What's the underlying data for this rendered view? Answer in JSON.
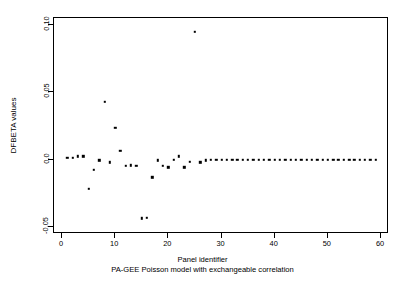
{
  "chart_data": {
    "type": "scatter",
    "title": "",
    "xlabel": "Panel identifier",
    "sublabel": "PA-GEE Poisson model with exchangeable correlation",
    "ylabel": "DFBETA values",
    "xlim": [
      -1.5,
      61.5
    ],
    "ylim": [
      -0.055,
      0.105
    ],
    "xticks": [
      0,
      10,
      20,
      30,
      40,
      50,
      60
    ],
    "xtick_labels": [
      "0",
      "10",
      "20",
      "30",
      "40",
      "50",
      "60"
    ],
    "yticks": [
      0.1,
      0.05,
      0.0,
      -0.05
    ],
    "ytick_labels": [
      "0.10",
      "0.05",
      "0.0",
      "-0.05"
    ],
    "grid": false,
    "legend": false,
    "marker": "filled-square",
    "marker_color": "#000000",
    "x": [
      1,
      2,
      3,
      4,
      5,
      6,
      7,
      8,
      9,
      10,
      11,
      12,
      13,
      14,
      15,
      16,
      17,
      18,
      19,
      20,
      21,
      22,
      23,
      24,
      25,
      26,
      27,
      28,
      29,
      30,
      31,
      32,
      33,
      34,
      35,
      36,
      37,
      38,
      39,
      40,
      41,
      42,
      43,
      44,
      45,
      46,
      47,
      48,
      49,
      50,
      51,
      52,
      53,
      54,
      55,
      56,
      57,
      58,
      59
    ],
    "y": [
      0.0015,
      0.0015,
      0.0025,
      0.0025,
      -0.0215,
      -0.0075,
      -0.0005,
      0.043,
      -0.002,
      0.0235,
      0.0065,
      -0.0045,
      -0.004,
      -0.0045,
      -0.0435,
      -0.043,
      -0.013,
      -0.0005,
      -0.0045,
      -0.0055,
      0.0,
      0.0025,
      -0.0055,
      -0.0015,
      0.095,
      -0.002,
      -0.0005,
      0.0,
      0.0,
      0.0,
      0.0,
      0.0,
      0.0,
      0.0,
      0.0,
      0.0,
      0.0,
      0.0,
      0.0,
      0.0,
      0.0,
      0.0,
      0.0,
      0.0,
      0.0,
      0.0,
      0.0,
      0.0,
      0.0,
      0.0,
      0.0,
      0.0,
      0.0,
      0.0,
      0.0,
      0.0,
      0.0,
      0.0,
      0.0
    ]
  }
}
